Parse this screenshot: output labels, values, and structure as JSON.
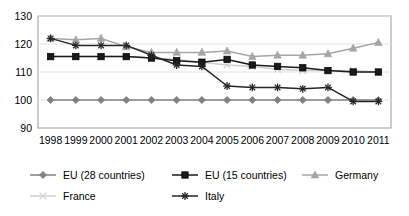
{
  "chart_data": {
    "type": "line",
    "title": "",
    "xlabel": "",
    "ylabel": "",
    "x": [
      1998,
      1999,
      2000,
      2001,
      2002,
      2003,
      2004,
      2005,
      2006,
      2007,
      2008,
      2009,
      2010,
      2011
    ],
    "xtick_labels": [
      "1998",
      "1999",
      "2000",
      "2001",
      "2002",
      "2003",
      "2004",
      "2005",
      "2006",
      "2007",
      "2008",
      "2009",
      "2010",
      "2011"
    ],
    "ytick_labels": [
      "90",
      "100",
      "110",
      "120",
      "130"
    ],
    "yticks": [
      90,
      100,
      110,
      120,
      130
    ],
    "ylim": [
      90,
      130
    ],
    "grid": "horizontal",
    "legend_position": "bottom",
    "series": [
      {
        "name": "EU (28 countries)",
        "marker": "diamond",
        "color": "#808080",
        "values": [
          100,
          100,
          100,
          100,
          100,
          100,
          100,
          100,
          100,
          100,
          100,
          100,
          100,
          100
        ]
      },
      {
        "name": "EU (15 countries)",
        "marker": "square",
        "color": "#1a1a1a",
        "values": [
          115.5,
          115.5,
          115.5,
          115.5,
          115,
          114,
          113.5,
          114.5,
          112.5,
          112,
          111.5,
          110.5,
          110,
          110
        ]
      },
      {
        "name": "Germany",
        "marker": "triangle",
        "color": "#a6a6a6",
        "values": [
          122,
          121.5,
          122,
          119,
          117,
          117,
          117,
          117.5,
          115.5,
          116,
          116,
          116.5,
          118.5,
          120.5
        ]
      },
      {
        "name": "France",
        "marker": "cross",
        "color": "#cfcfcf",
        "values": [
          115.5,
          115.5,
          115.5,
          115.5,
          115,
          114.5,
          113.5,
          112.5,
          112,
          111,
          110.5,
          110.5,
          110.5,
          110
        ]
      },
      {
        "name": "Italy",
        "marker": "asterisk",
        "color": "#262626",
        "values": [
          122,
          119.5,
          119.5,
          119.5,
          116,
          112.5,
          112,
          105,
          104.5,
          104.5,
          104,
          104.5,
          99.5,
          99.5
        ]
      }
    ]
  },
  "axes": {
    "y_labels": [
      "130",
      "120",
      "110",
      "100",
      "90"
    ],
    "x_labels": [
      "1998",
      "1999",
      "2000",
      "2001",
      "2002",
      "2003",
      "2004",
      "2005",
      "2006",
      "2007",
      "2008",
      "2009",
      "2010",
      "2011"
    ]
  },
  "legend": {
    "items": [
      {
        "label": "EU (28 countries)",
        "marker": "diamond-marker-icon",
        "color": "#808080"
      },
      {
        "label": "EU (15 countries)",
        "marker": "square-marker-icon",
        "color": "#1a1a1a"
      },
      {
        "label": "Germany",
        "marker": "triangle-marker-icon",
        "color": "#a6a6a6"
      },
      {
        "label": "France",
        "marker": "cross-marker-icon",
        "color": "#cfcfcf"
      },
      {
        "label": "Italy",
        "marker": "asterisk-marker-icon",
        "color": "#262626"
      }
    ]
  }
}
